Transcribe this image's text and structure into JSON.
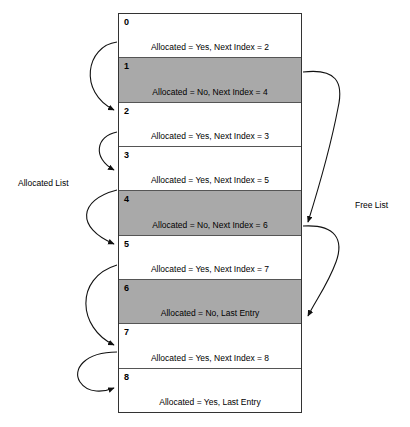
{
  "diagram": {
    "title_left": "Allocated List",
    "title_right": "Free List",
    "colors": {
      "free_fill": "#a9a9a9",
      "allocated_fill": "#ffffff",
      "border": "#333333",
      "text": "#000000"
    },
    "rows": [
      {
        "index": "0",
        "detail": "Allocated = Yes, Next Index = 2",
        "allocated": "Yes",
        "next_index": "2",
        "state": "allocated"
      },
      {
        "index": "1",
        "detail": "Allocated = No, Next Index = 4",
        "allocated": "No",
        "next_index": "4",
        "state": "free"
      },
      {
        "index": "2",
        "detail": "Allocated = Yes, Next Index = 3",
        "allocated": "Yes",
        "next_index": "3",
        "state": "allocated"
      },
      {
        "index": "3",
        "detail": "Allocated = Yes, Next Index = 5",
        "allocated": "Yes",
        "next_index": "5",
        "state": "allocated"
      },
      {
        "index": "4",
        "detail": "Allocated = No, Next Index = 6",
        "allocated": "No",
        "next_index": "6",
        "state": "free"
      },
      {
        "index": "5",
        "detail": "Allocated = Yes, Next Index = 7",
        "allocated": "Yes",
        "next_index": "7",
        "state": "allocated"
      },
      {
        "index": "6",
        "detail": "Allocated = No, Last Entry",
        "allocated": "No",
        "next_index": "Last Entry",
        "state": "free"
      },
      {
        "index": "7",
        "detail": "Allocated = Yes, Next Index = 8",
        "allocated": "Yes",
        "next_index": "8",
        "state": "allocated"
      },
      {
        "index": "8",
        "detail": "Allocated = Yes, Last Entry",
        "allocated": "Yes",
        "next_index": "Last Entry",
        "state": "allocated"
      }
    ],
    "allocated_list_links": [
      {
        "from": "0",
        "to": "2"
      },
      {
        "from": "2",
        "to": "3"
      },
      {
        "from": "3",
        "to": "5"
      },
      {
        "from": "5",
        "to": "7"
      },
      {
        "from": "7",
        "to": "8"
      }
    ],
    "free_list_links": [
      {
        "from": "1",
        "to": "4"
      },
      {
        "from": "4",
        "to": "6"
      }
    ]
  }
}
